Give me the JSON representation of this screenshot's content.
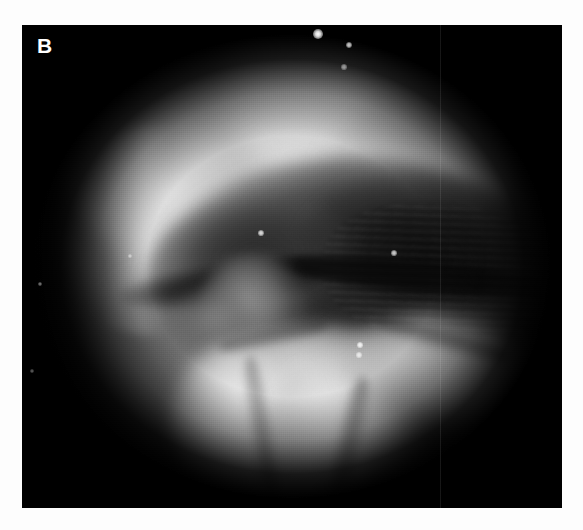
{
  "figure": {
    "panel_label": "B",
    "modality": "endoscopic-photograph",
    "colorspace": "grayscale",
    "canvas": {
      "width": 583,
      "height": 530,
      "background_color": "#fdfdfd"
    },
    "photo_panel": {
      "left": 22,
      "top": 25,
      "width": 540,
      "height": 483,
      "border_color": "#050505",
      "field_shape": "circular-endoscope-view"
    },
    "palette": {
      "page_background": "#fdfdfd",
      "frame_black": "#050505",
      "deep_shadow": "#0a0a0a",
      "cavity_dark": "#1e1e1e",
      "mid_gray_tissue": "#8c8c8c",
      "light_tissue": "#c8c8c8",
      "bright_mucosa": "#e8e8e8",
      "specular_white": "#ffffff",
      "label_color": "#ffffff"
    },
    "regions": [
      {
        "name": "upper-bright-arch",
        "tone": "light",
        "description": "broad bright mucosal band arching across the top of the field"
      },
      {
        "name": "left-bright-fold",
        "tone": "light",
        "description": "bright folded tissue ridge on the left wall"
      },
      {
        "name": "right-bright-band",
        "tone": "light",
        "description": "bright tissue sweeping down the right wall"
      },
      {
        "name": "dark-cavity",
        "tone": "dark",
        "description": "large dark pharyngeal / glottic opening across the middle"
      },
      {
        "name": "cavity-ridges",
        "tone": "dark",
        "description": "horizontal ridged texture inside the right dark cavity"
      },
      {
        "name": "midline-nodule",
        "tone": "mid",
        "description": "rounded nodular tissue at the midline below the cavity notch"
      },
      {
        "name": "bright-lobulated-mass",
        "tone": "bright",
        "description": "large bright lobulated mass filling the lower centre of the field"
      },
      {
        "name": "lower-left-wall",
        "tone": "mid-dark",
        "description": "dull grey wall in the lower-left quadrant"
      }
    ],
    "specular_highlights": [
      {
        "x": 318,
        "y": 34,
        "r": 3.0,
        "intensity": 1.0
      },
      {
        "x": 349,
        "y": 45,
        "r": 2.0,
        "intensity": 0.8
      },
      {
        "x": 344,
        "y": 67,
        "r": 1.6,
        "intensity": 0.55
      },
      {
        "x": 261,
        "y": 233,
        "r": 1.8,
        "intensity": 0.85
      },
      {
        "x": 394,
        "y": 253,
        "r": 1.8,
        "intensity": 0.8
      },
      {
        "x": 130,
        "y": 256,
        "r": 1.4,
        "intensity": 0.5
      },
      {
        "x": 360,
        "y": 345,
        "r": 1.8,
        "intensity": 0.9
      },
      {
        "x": 359,
        "y": 355,
        "r": 1.6,
        "intensity": 0.75
      },
      {
        "x": 40,
        "y": 284,
        "r": 1.3,
        "intensity": 0.45
      },
      {
        "x": 32,
        "y": 371,
        "r": 1.2,
        "intensity": 0.35
      }
    ],
    "artifacts": [
      {
        "name": "vertical-scan-line",
        "x": 440,
        "width": 1,
        "description": "faint vertical scan-line running the full height of the panel"
      },
      {
        "name": "film-grain",
        "description": "fine dithered print grain over the whole photograph"
      }
    ]
  }
}
